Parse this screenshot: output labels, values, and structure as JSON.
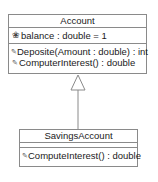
{
  "diagram": {
    "type": "uml-class-diagram",
    "classes": [
      {
        "name": "Account",
        "attributes": [
          {
            "icon": "attribute-icon",
            "text": "balance : double = 1"
          }
        ],
        "operations": [
          {
            "icon": "operation-icon",
            "text": "Deposite(Amount : double) : int"
          },
          {
            "icon": "operation-icon",
            "text": "ComputerInterest() : double"
          }
        ]
      },
      {
        "name": "SavingsAccount",
        "attributes": [],
        "operations": [
          {
            "icon": "operation-icon",
            "text": "ComputeInterest() : double"
          }
        ]
      }
    ],
    "relationships": [
      {
        "type": "generalization",
        "from": "SavingsAccount",
        "to": "Account"
      }
    ],
    "colors": {
      "border": "#8a8a8a",
      "text": "#1a1a1a",
      "background": "#ffffff"
    }
  }
}
